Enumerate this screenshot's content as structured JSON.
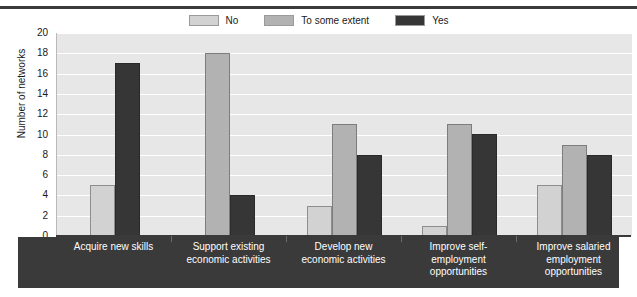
{
  "chart_data": {
    "type": "bar",
    "title": "",
    "xlabel": "",
    "ylabel": "Number of networks",
    "ylim": [
      0,
      20
    ],
    "ytick_step": 2,
    "yticks": [
      20,
      18,
      16,
      14,
      12,
      10,
      8,
      6,
      4,
      2,
      0
    ],
    "grid": true,
    "legend_position": "top-center",
    "categories": [
      "Acquire new skills",
      "Support existing\neconomic activities",
      "Develop new\neconomic activities",
      "Improve self-\nemployment\nopportunities",
      "Improve salaried\nemployment\nopportunities"
    ],
    "category_lines": [
      [
        "Acquire new skills"
      ],
      [
        "Support existing",
        "economic activities"
      ],
      [
        "Develop new",
        "economic activities"
      ],
      [
        "Improve self-",
        "employment",
        "opportunities"
      ],
      [
        "Improve salaried",
        "employment",
        "opportunities"
      ]
    ],
    "series": [
      {
        "name": "No",
        "color": "#d2d2d2",
        "values": [
          5,
          0,
          3,
          1,
          5
        ]
      },
      {
        "name": "To some extent",
        "color": "#b2b2b2",
        "values": [
          0,
          18,
          11,
          11,
          9
        ]
      },
      {
        "name": "Yes",
        "color": "#363636",
        "values": [
          17,
          4,
          8,
          10,
          8
        ]
      }
    ]
  },
  "legend": {
    "items": [
      {
        "label": "No",
        "color": "#d2d2d2"
      },
      {
        "label": "To some extent",
        "color": "#b2b2b2"
      },
      {
        "label": "Yes",
        "color": "#363636"
      }
    ]
  },
  "axes": {
    "y_title": "Number of networks"
  }
}
